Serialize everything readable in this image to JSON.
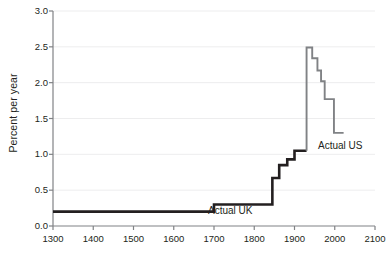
{
  "chart_data": {
    "type": "line",
    "title": "",
    "xlabel": "",
    "ylabel": "Percent per year",
    "xlim": [
      1300,
      2100
    ],
    "ylim": [
      0.0,
      3.0
    ],
    "grid": "horizontal-faint",
    "legend_position": "inline-annotations",
    "x_ticks": [
      1300,
      1400,
      1500,
      1600,
      1700,
      1800,
      1900,
      2000,
      2100
    ],
    "x_tick_labels": [
      "1300",
      "1400",
      "1500",
      "1600",
      "1700",
      "1800",
      "1900",
      "2000",
      "2100"
    ],
    "y_ticks": [
      0.0,
      0.5,
      1.0,
      1.5,
      2.0,
      2.5,
      3.0
    ],
    "y_tick_labels": [
      "0.0",
      "0.5",
      "1.0",
      "1.5",
      "2.0",
      "2.5",
      "3.0"
    ],
    "series": [
      {
        "name": "Actual UK",
        "color": "#231f20",
        "style": "step",
        "annotation": "Actual UK",
        "x": [
          1300,
          1700,
          1700,
          1820,
          1820,
          1845,
          1845,
          1850,
          1850,
          1860,
          1860,
          1870,
          1870,
          1880,
          1880,
          1895,
          1895,
          1905,
          1905,
          1930
        ],
        "y": [
          0.2,
          0.2,
          0.3,
          0.3,
          0.3,
          0.3,
          0.45,
          0.45,
          0.67,
          0.67,
          0.68,
          0.68,
          0.85,
          0.85,
          0.88,
          0.88,
          0.93,
          0.93,
          1.05,
          1.05
        ],
        "points": [
          {
            "x": 1300,
            "y": 0.2
          },
          {
            "x": 1700,
            "y": 0.2
          },
          {
            "x": 1700,
            "y": 0.3
          },
          {
            "x": 1845,
            "y": 0.3
          },
          {
            "x": 1845,
            "y": 0.67
          },
          {
            "x": 1862,
            "y": 0.67
          },
          {
            "x": 1862,
            "y": 0.85
          },
          {
            "x": 1882,
            "y": 0.85
          },
          {
            "x": 1882,
            "y": 0.93
          },
          {
            "x": 1900,
            "y": 0.93
          },
          {
            "x": 1900,
            "y": 1.05
          },
          {
            "x": 1930,
            "y": 1.05
          }
        ]
      },
      {
        "name": "Actual US",
        "color": "#808285",
        "style": "step",
        "annotation": "Actual US",
        "points": [
          {
            "x": 1930,
            "y": 1.05
          },
          {
            "x": 1930,
            "y": 2.49
          },
          {
            "x": 1944,
            "y": 2.49
          },
          {
            "x": 1944,
            "y": 2.34
          },
          {
            "x": 1957,
            "y": 2.34
          },
          {
            "x": 1957,
            "y": 2.17
          },
          {
            "x": 1966,
            "y": 2.17
          },
          {
            "x": 1966,
            "y": 2.02
          },
          {
            "x": 1975,
            "y": 2.02
          },
          {
            "x": 1975,
            "y": 1.77
          },
          {
            "x": 1998,
            "y": 1.77
          },
          {
            "x": 1998,
            "y": 1.3
          },
          {
            "x": 2022,
            "y": 1.3
          }
        ]
      }
    ],
    "annotations": [
      {
        "text": "Actual UK",
        "x": 1820,
        "y": 0.18
      },
      {
        "text": "Actual US",
        "x": 1985,
        "y": 1.16
      }
    ]
  },
  "axes": {
    "y_title": "Percent per year"
  }
}
